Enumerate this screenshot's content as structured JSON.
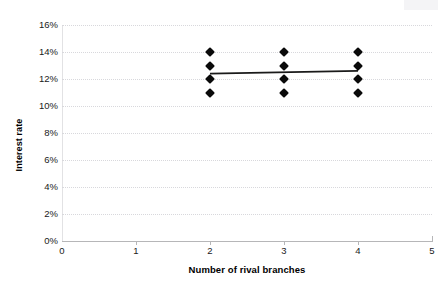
{
  "chart_data": {
    "type": "scatter",
    "title": "",
    "xlabel": "Number of rival branches",
    "ylabel": "Interest rate",
    "xlim": [
      0,
      5
    ],
    "ylim": [
      0,
      0.16
    ],
    "grid": true,
    "legend": "none",
    "x_tick_labels": [
      "0",
      "1",
      "2",
      "3",
      "4",
      "5"
    ],
    "x_tick_values": [
      0,
      1,
      2,
      3,
      4,
      5
    ],
    "y_tick_labels": [
      "0%",
      "2%",
      "4%",
      "6%",
      "8%",
      "10%",
      "12%",
      "14%",
      "16%"
    ],
    "y_tick_values": [
      0,
      2,
      4,
      6,
      8,
      10,
      12,
      14,
      16
    ],
    "points": [
      {
        "x": 2,
        "y": 14
      },
      {
        "x": 2,
        "y": 13
      },
      {
        "x": 2,
        "y": 12
      },
      {
        "x": 2,
        "y": 11
      },
      {
        "x": 3,
        "y": 14
      },
      {
        "x": 3,
        "y": 13
      },
      {
        "x": 3,
        "y": 12
      },
      {
        "x": 3,
        "y": 11
      },
      {
        "x": 4,
        "y": 14
      },
      {
        "x": 4,
        "y": 13
      },
      {
        "x": 4,
        "y": 12
      },
      {
        "x": 4,
        "y": 11
      }
    ],
    "trendline": {
      "type": "line",
      "x": [
        2,
        4
      ],
      "y": [
        12.4,
        12.6
      ],
      "color": "#1a1a1a"
    },
    "marker": "diamond",
    "marker_color": "#0a0a0a",
    "gridline_color": "#d8d8dc",
    "axis_color": "#b6b6b8",
    "background": "#ffffff"
  }
}
